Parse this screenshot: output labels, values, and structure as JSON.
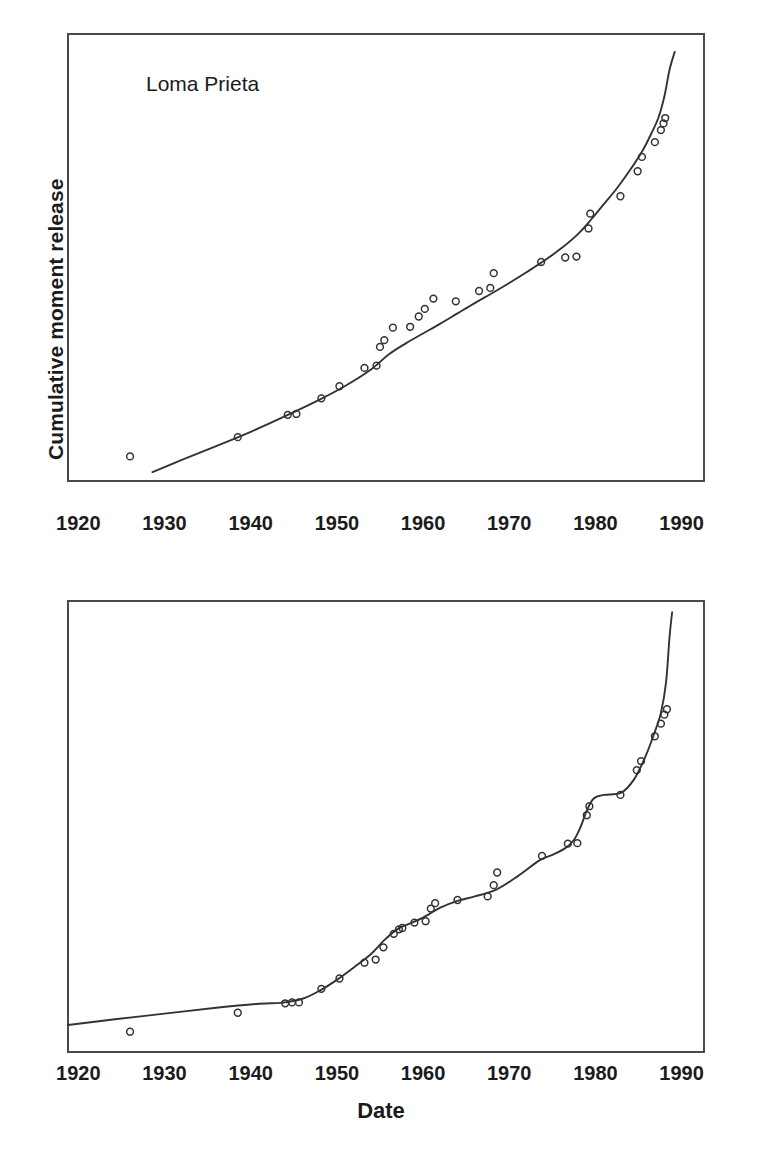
{
  "figure": {
    "background": "#ffffff",
    "ink_color": "#333333",
    "frame_color": "#4a4a4a"
  },
  "axis": {
    "tick_labels": [
      "1920",
      "1930",
      "1940",
      "1950",
      "1960",
      "1970",
      "1980",
      "1990"
    ],
    "tick_values": [
      1920,
      1930,
      1940,
      1950,
      1960,
      1970,
      1980,
      1990
    ],
    "xlabel": "Date",
    "ylabel": "Cumulative moment release"
  },
  "panels": {
    "top": {
      "annotation": "Loma Prieta",
      "ylabel": "Cumulative moment release"
    },
    "bottom": {
      "ylabel": "Cumulative moment release",
      "xlabel": "Date"
    }
  },
  "chart_data": [
    {
      "id": "top-panel",
      "type": "scatter",
      "title": "Loma Prieta",
      "xlabel": "",
      "ylabel": "Cumulative moment release",
      "xlim": [
        1918.8,
        1992.6
      ],
      "ylim": [
        0,
        1
      ],
      "grid": false,
      "legend": "none",
      "axis_note": "y-axis unlabeled (arbitrary cumulative moment units); x tick labels every 10 years",
      "series": [
        {
          "name": "observed cumulative moment (open circles)",
          "marker": "open-circle",
          "points": [
            [
              1926.0,
              0.055
            ],
            [
              1938.5,
              0.098
            ],
            [
              1944.3,
              0.148
            ],
            [
              1945.3,
              0.15
            ],
            [
              1948.2,
              0.185
            ],
            [
              1950.3,
              0.212
            ],
            [
              1953.2,
              0.253
            ],
            [
              1954.6,
              0.258
            ],
            [
              1955.0,
              0.3
            ],
            [
              1955.5,
              0.315
            ],
            [
              1956.5,
              0.343
            ],
            [
              1958.5,
              0.345
            ],
            [
              1959.5,
              0.368
            ],
            [
              1960.2,
              0.385
            ],
            [
              1961.2,
              0.408
            ],
            [
              1963.8,
              0.402
            ],
            [
              1966.5,
              0.425
            ],
            [
              1967.8,
              0.432
            ],
            [
              1968.2,
              0.465
            ],
            [
              1973.7,
              0.49
            ],
            [
              1976.5,
              0.5
            ],
            [
              1977.8,
              0.502
            ],
            [
              1979.2,
              0.565
            ],
            [
              1979.4,
              0.598
            ],
            [
              1982.9,
              0.637
            ],
            [
              1984.9,
              0.693
            ],
            [
              1985.4,
              0.725
            ],
            [
              1986.9,
              0.758
            ],
            [
              1987.6,
              0.785
            ],
            [
              1987.9,
              0.8
            ],
            [
              1988.1,
              0.812
            ]
          ]
        },
        {
          "name": "model curve",
          "marker": "line",
          "points": [
            [
              1928.6,
              0.02
            ],
            [
              1932.0,
              0.047
            ],
            [
              1936.0,
              0.078
            ],
            [
              1940.0,
              0.11
            ],
            [
              1944.0,
              0.145
            ],
            [
              1948.0,
              0.182
            ],
            [
              1951.0,
              0.213
            ],
            [
              1954.0,
              0.25
            ],
            [
              1956.0,
              0.283
            ],
            [
              1958.0,
              0.308
            ],
            [
              1960.0,
              0.33
            ],
            [
              1962.0,
              0.352
            ],
            [
              1964.0,
              0.375
            ],
            [
              1966.0,
              0.398
            ],
            [
              1968.0,
              0.42
            ],
            [
              1970.0,
              0.443
            ],
            [
              1972.0,
              0.467
            ],
            [
              1974.0,
              0.492
            ],
            [
              1976.0,
              0.52
            ],
            [
              1978.0,
              0.553
            ],
            [
              1979.5,
              0.585
            ],
            [
              1981.0,
              0.62
            ],
            [
              1982.5,
              0.655
            ],
            [
              1984.0,
              0.695
            ],
            [
              1985.5,
              0.74
            ],
            [
              1986.5,
              0.778
            ],
            [
              1987.3,
              0.812
            ],
            [
              1988.0,
              0.86
            ],
            [
              1988.6,
              0.92
            ],
            [
              1989.2,
              0.96
            ]
          ]
        }
      ]
    },
    {
      "id": "bottom-panel",
      "type": "scatter",
      "title": "",
      "xlabel": "Date",
      "ylabel": "Cumulative moment release",
      "xlim": [
        1918.8,
        1992.6
      ],
      "ylim": [
        0,
        1
      ],
      "grid": false,
      "legend": "none",
      "axis_note": "y-axis unlabeled (arbitrary cumulative moment units); stepped / staircase model curve",
      "series": [
        {
          "name": "observed cumulative moment (open circles)",
          "marker": "open-circle",
          "points": [
            [
              1926.0,
              0.045
            ],
            [
              1938.5,
              0.087
            ],
            [
              1944.0,
              0.108
            ],
            [
              1944.8,
              0.11
            ],
            [
              1945.6,
              0.11
            ],
            [
              1948.2,
              0.14
            ],
            [
              1950.3,
              0.163
            ],
            [
              1953.2,
              0.198
            ],
            [
              1954.5,
              0.205
            ],
            [
              1955.4,
              0.232
            ],
            [
              1956.6,
              0.262
            ],
            [
              1957.2,
              0.272
            ],
            [
              1957.6,
              0.275
            ],
            [
              1959.0,
              0.287
            ],
            [
              1960.3,
              0.29
            ],
            [
              1960.9,
              0.318
            ],
            [
              1961.4,
              0.33
            ],
            [
              1964.0,
              0.337
            ],
            [
              1967.5,
              0.345
            ],
            [
              1968.2,
              0.37
            ],
            [
              1968.6,
              0.398
            ],
            [
              1973.8,
              0.435
            ],
            [
              1976.8,
              0.462
            ],
            [
              1977.9,
              0.463
            ],
            [
              1979.0,
              0.525
            ],
            [
              1979.3,
              0.545
            ],
            [
              1982.9,
              0.57
            ],
            [
              1984.8,
              0.625
            ],
            [
              1985.3,
              0.645
            ],
            [
              1986.9,
              0.7
            ],
            [
              1987.6,
              0.728
            ],
            [
              1988.0,
              0.748
            ],
            [
              1988.3,
              0.76
            ]
          ]
        },
        {
          "name": "model curve",
          "marker": "line",
          "points": [
            [
              1918.8,
              0.06
            ],
            [
              1924.0,
              0.072
            ],
            [
              1930.0,
              0.085
            ],
            [
              1936.0,
              0.098
            ],
            [
              1941.0,
              0.107
            ],
            [
              1943.5,
              0.109
            ],
            [
              1946.0,
              0.118
            ],
            [
              1948.0,
              0.136
            ],
            [
              1950.0,
              0.16
            ],
            [
              1952.0,
              0.188
            ],
            [
              1954.0,
              0.218
            ],
            [
              1955.5,
              0.248
            ],
            [
              1957.0,
              0.272
            ],
            [
              1958.5,
              0.285
            ],
            [
              1960.0,
              0.298
            ],
            [
              1962.0,
              0.32
            ],
            [
              1964.0,
              0.335
            ],
            [
              1966.0,
              0.345
            ],
            [
              1968.5,
              0.36
            ],
            [
              1971.0,
              0.39
            ],
            [
              1973.5,
              0.425
            ],
            [
              1975.0,
              0.437
            ],
            [
              1976.5,
              0.452
            ],
            [
              1977.5,
              0.47
            ],
            [
              1978.3,
              0.5
            ],
            [
              1979.0,
              0.535
            ],
            [
              1979.8,
              0.562
            ],
            [
              1981.0,
              0.57
            ],
            [
              1983.0,
              0.575
            ],
            [
              1984.5,
              0.605
            ],
            [
              1985.8,
              0.655
            ],
            [
              1986.8,
              0.705
            ],
            [
              1987.6,
              0.752
            ],
            [
              1988.2,
              0.82
            ],
            [
              1988.6,
              0.92
            ],
            [
              1988.9,
              0.975
            ]
          ]
        }
      ]
    }
  ]
}
